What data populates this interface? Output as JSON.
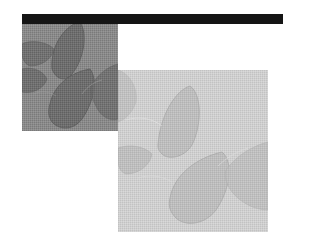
{
  "graphic": {
    "top_bar": {
      "color": "#151515"
    },
    "panel_dark": {
      "background": "#8a8a8a",
      "shape_fill": "#6e6e6e",
      "shape_edge": "#5a5a5a",
      "highlight": "#9c9c9c"
    },
    "panel_light": {
      "background": "#cfcfcf",
      "shape_fill": "#bdbdbd",
      "shape_edge": "#a8a8a8",
      "highlight": "#dadada"
    }
  }
}
